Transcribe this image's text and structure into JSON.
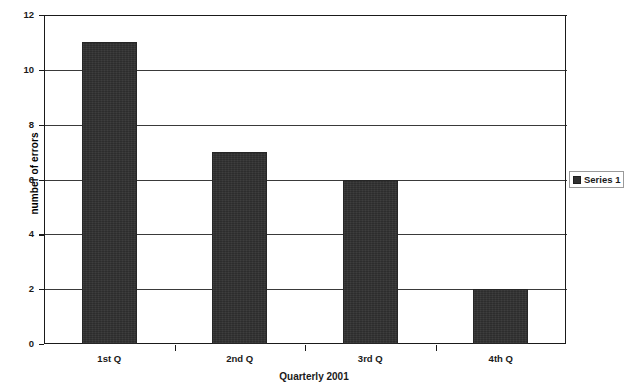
{
  "chart_data": {
    "type": "bar",
    "title": "",
    "categories": [
      "1st Q",
      "2nd Q",
      "3rd Q",
      "4th Q"
    ],
    "values": [
      11,
      7,
      6,
      2
    ],
    "series": [
      {
        "name": "Series 1",
        "values": [
          11,
          7,
          6,
          2
        ]
      }
    ],
    "xlabel": "Quarterly 2001",
    "ylabel": "number of errors",
    "ylim": [
      0,
      12
    ],
    "ytick_labels": [
      "0",
      "2",
      "4",
      "6",
      "8",
      "10",
      "12"
    ],
    "ytick_values": [
      0,
      2,
      4,
      6,
      8,
      10,
      12
    ],
    "grid": "horizontal",
    "legend_position": "right",
    "colors": {
      "bar_fill": "#313131",
      "axis": "#1a1a1a",
      "gridline": "#3a3a3a",
      "background": "#ffffff",
      "legend_border": "#9a9a9a"
    }
  },
  "legend": {
    "entries": [
      {
        "label": "Series 1",
        "marker": "filled-square-marker"
      }
    ]
  }
}
